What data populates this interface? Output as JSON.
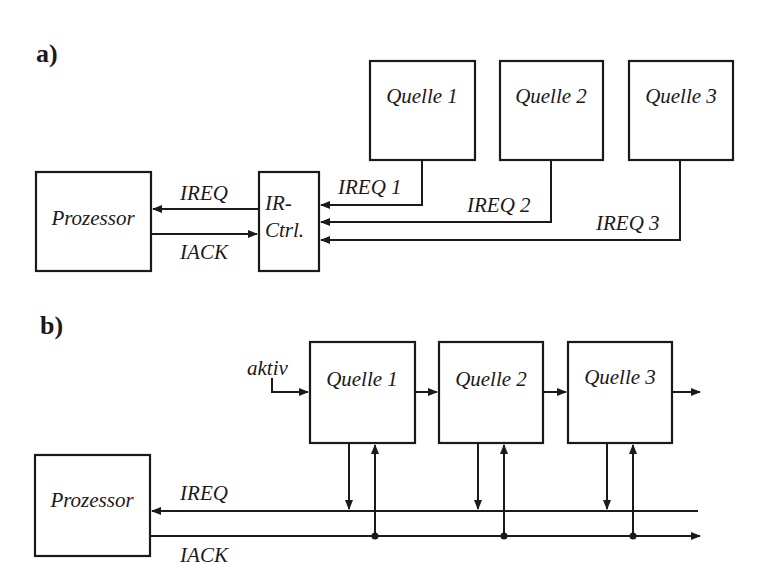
{
  "diagram_a": {
    "section_label": "a)",
    "processor": "Prozessor",
    "controller_line1": "IR-",
    "controller_line2": "Ctrl.",
    "signal_ireq": "IREQ",
    "signal_iack": "IACK",
    "sources": [
      {
        "label": "Quelle 1",
        "request": "IREQ 1"
      },
      {
        "label": "Quelle 2",
        "request": "IREQ 2"
      },
      {
        "label": "Quelle 3",
        "request": "IREQ 3"
      }
    ]
  },
  "diagram_b": {
    "section_label": "b)",
    "processor": "Prozessor",
    "chain_input": "aktiv",
    "signal_ireq": "IREQ",
    "signal_iack": "IACK",
    "sources": [
      {
        "label": "Quelle 1"
      },
      {
        "label": "Quelle 2"
      },
      {
        "label": "Quelle 3"
      }
    ]
  }
}
